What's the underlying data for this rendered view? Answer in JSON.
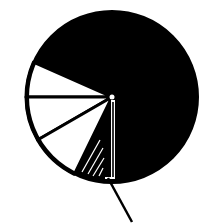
{
  "chart_data": {
    "type": "pie",
    "title": "",
    "xlabel": "",
    "ylabel": "",
    "legend": [],
    "center": [
      112,
      97
    ],
    "radius": 86,
    "colors": {
      "fill_dark": "#000000",
      "fill_light": "#ffffff",
      "background": "#ffffff"
    },
    "slices": [
      {
        "name": "large-black-segment",
        "start_deg": -156,
        "end_deg": 90,
        "fill": "#000000",
        "approx_share_pct": 68.3
      },
      {
        "name": "white-segment-1",
        "start_deg": 180,
        "end_deg": 204,
        "fill": "#ffffff",
        "approx_share_pct": 6.7
      },
      {
        "name": "white-segment-2",
        "start_deg": 150,
        "end_deg": 180,
        "fill": "#ffffff",
        "approx_share_pct": 8.3
      },
      {
        "name": "white-segment-3",
        "start_deg": 116,
        "end_deg": 150,
        "fill": "#ffffff",
        "approx_share_pct": 9.4
      },
      {
        "name": "black-hatched-wedge",
        "start_deg": 90,
        "end_deg": 116,
        "fill": "#000000",
        "approx_share_pct": 7.2
      }
    ],
    "hatch_lines": [
      {
        "x1": 100,
        "y1": 140,
        "x2": 82,
        "y2": 172
      },
      {
        "x1": 103,
        "y1": 148,
        "x2": 88,
        "y2": 174
      },
      {
        "x1": 104,
        "y1": 158,
        "x2": 93,
        "y2": 176
      },
      {
        "x1": 103,
        "y1": 168,
        "x2": 99,
        "y2": 176
      }
    ],
    "vertical_bar": {
      "x": 111,
      "y_top": 100,
      "y_bottom": 179,
      "width": 4
    },
    "pointer_line": {
      "x1": 108,
      "y1": 178,
      "x2": 132,
      "y2": 222
    },
    "annotations": []
  }
}
